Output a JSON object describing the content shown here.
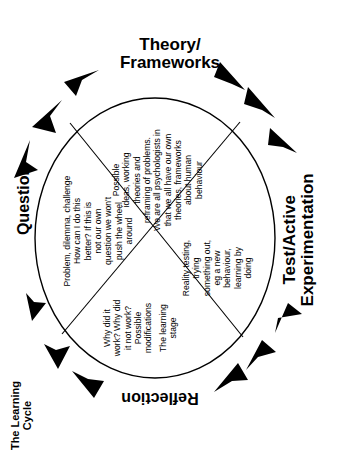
{
  "title": {
    "line1": "The Learning",
    "line2": "Cycle"
  },
  "stages": {
    "theory": {
      "line1": "Theory/",
      "line2": "Frameworks",
      "text": [
        "Possible",
        "ideas, working",
        "theories and",
        "reframing of problems.",
        "We are all psychologists in",
        "that we all have our own",
        "theories, frameworks",
        "about human",
        "behaviour"
      ]
    },
    "test": {
      "line1": "Test/Active",
      "line2": "Experimentation",
      "text": [
        "Reality testing,",
        "trying",
        "something out,",
        "eg a new",
        "behaviour,",
        "learning by",
        "doing"
      ]
    },
    "reflection": {
      "label": "Reflection",
      "text": [
        "Why did it",
        "work? Why did",
        "it not work?",
        "Possible",
        "modifications",
        "The learning",
        "stage"
      ]
    },
    "question": {
      "label": "Question",
      "text": [
        "Problem, dilemma, challenge",
        "How can I do this",
        "better? If this is",
        "not our own",
        "question we won't",
        "push the wheel",
        "around"
      ]
    }
  },
  "colors": {
    "stroke": "#000000",
    "background": "#ffffff"
  }
}
